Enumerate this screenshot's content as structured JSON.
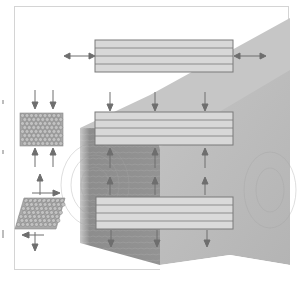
{
  "figure": {
    "colors": {
      "background": "#ffffff",
      "frame": "#d4d4d4",
      "wood_top_face": "#c9c9c9",
      "wood_front_face": "#8f8f8f",
      "wood_front_light": "#b5b5b5",
      "wood_right_face": "#bdbdbd",
      "panel_fill": "#d6d6d6",
      "panel_stroke": "#7a7a7a",
      "arrow": "#6e6e6e",
      "lattice_dot": "#a8a8a8",
      "lattice_stroke": "#6f6f6f"
    },
    "panels": [
      {
        "name": "top-panel",
        "layers": 4,
        "x": 95,
        "y": 40,
        "width": 138,
        "height": 32
      },
      {
        "name": "middle-panel",
        "layers": 4,
        "x": 95,
        "y": 112,
        "width": 138,
        "height": 33
      },
      {
        "name": "bottom-panel",
        "layers": 4,
        "x": 96,
        "y": 197,
        "width": 137,
        "height": 32
      }
    ],
    "insets": [
      {
        "name": "lattice-square",
        "shape": "square",
        "forces": "compression"
      },
      {
        "name": "lattice-parallelogram",
        "shape": "parallelogram",
        "forces": "shear"
      }
    ]
  }
}
